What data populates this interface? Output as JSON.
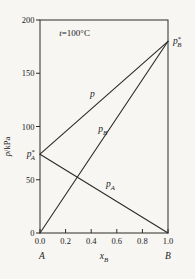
{
  "page": {
    "background_color": "#f7f6f2"
  },
  "figure": {
    "kind": "vapor pressure vs composition diagram for ideal binary liquid mixture",
    "temperature_label": "t=100°C"
  },
  "chart_data": {
    "type": "line",
    "title": "",
    "xlabel": "x_B",
    "ylabel": "p/kPa",
    "xlim": [
      0,
      1
    ],
    "ylim": [
      0,
      200
    ],
    "grid": false,
    "legend_position": "inline labels on lines",
    "line_color": "#2b2a28",
    "text_color": "#22211f",
    "x_ticks": [
      {
        "v": 0.0,
        "label": "0.0"
      },
      {
        "v": 0.2,
        "label": "0.2"
      },
      {
        "v": 0.4,
        "label": "0.4"
      },
      {
        "v": 0.6,
        "label": "0.6"
      },
      {
        "v": 0.8,
        "label": "0.8"
      },
      {
        "v": 1.0,
        "label": "1.0"
      }
    ],
    "y_ticks": [
      {
        "v": 0,
        "label": "0"
      },
      {
        "v": 50,
        "label": "50"
      },
      {
        "v": 100,
        "label": "100"
      },
      {
        "v": 150,
        "label": "150"
      },
      {
        "v": 200,
        "label": "200"
      }
    ],
    "endpoint_labels": {
      "left": "A",
      "right": "B"
    },
    "axis_titles": {
      "y": {
        "segments": [
          {
            "text": "p",
            "italic": true
          },
          {
            "text": "/kPa"
          }
        ]
      },
      "x": {
        "segments": [
          {
            "text": "x",
            "italic": true
          },
          {
            "text": "B",
            "sub": true,
            "italic": true
          }
        ]
      }
    },
    "annotations": [
      {
        "name": "temperature-annotation",
        "at": [
          0.27,
          185
        ],
        "font_size": 9,
        "segments": [
          {
            "text": "t",
            "italic": true
          },
          {
            "text": "=100°C"
          }
        ]
      }
    ],
    "series": [
      {
        "name": "total-pressure",
        "plain_label": "p",
        "points": [
          [
            0,
            74
          ],
          [
            1,
            180
          ]
        ],
        "label": {
          "at": [
            0.41,
            128
          ],
          "segments": [
            {
              "text": "p",
              "italic": true
            }
          ]
        }
      },
      {
        "name": "partial-pressure-B",
        "plain_label": "p_B",
        "points": [
          [
            0,
            0
          ],
          [
            1,
            180
          ]
        ],
        "label": {
          "at": [
            0.49,
            95
          ],
          "segments": [
            {
              "text": "p",
              "italic": true
            },
            {
              "text": "B",
              "sub": true,
              "italic": true
            }
          ]
        }
      },
      {
        "name": "partial-pressure-A",
        "plain_label": "p_A",
        "points": [
          [
            0,
            74
          ],
          [
            1,
            0
          ]
        ],
        "label": {
          "at": [
            0.55,
            43
          ],
          "segments": [
            {
              "text": "p",
              "italic": true
            },
            {
              "text": "A",
              "sub": true,
              "italic": true
            }
          ]
        }
      }
    ],
    "point_labels": [
      {
        "name": "pure-A-vapor-pressure",
        "plain_label": "p*_A",
        "value_kpa": 74,
        "x": 0,
        "y": 74,
        "side": "left",
        "segments": [
          {
            "text": "p",
            "italic": true
          },
          {
            "text": "*",
            "sup": true
          },
          {
            "text": "A",
            "sub": true,
            "italic": true
          }
        ]
      },
      {
        "name": "pure-B-vapor-pressure",
        "plain_label": "p*_B",
        "value_kpa": 180,
        "x": 1,
        "y": 180,
        "side": "right",
        "segments": [
          {
            "text": "p",
            "italic": true
          },
          {
            "text": "*",
            "sup": true
          },
          {
            "text": "B",
            "sub": true,
            "italic": true
          }
        ]
      }
    ]
  }
}
